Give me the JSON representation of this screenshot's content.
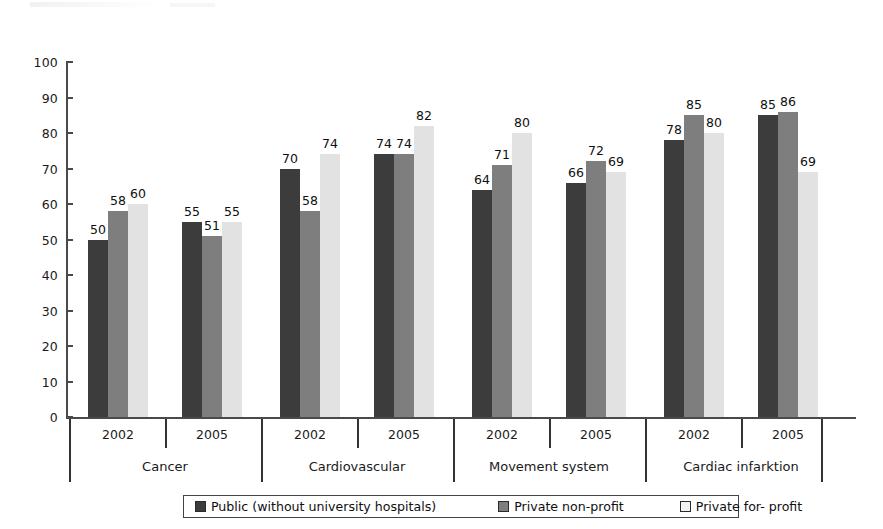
{
  "chart_data": {
    "type": "bar",
    "title": "",
    "subtitle": "",
    "xlabel": "",
    "ylabel": "",
    "ylim": [
      0,
      100
    ],
    "ytick_values": [
      0,
      10,
      20,
      30,
      40,
      50,
      60,
      70,
      80,
      90,
      100
    ],
    "grid": false,
    "legend_position": "bottom",
    "series": [
      {
        "name": "Public (without university hospitals)",
        "color": "#3c3c3c",
        "values": [
          50,
          55,
          70,
          74,
          64,
          66,
          78,
          85
        ]
      },
      {
        "name": "Private non-profit",
        "color": "#7e7e7e",
        "values": [
          58,
          51,
          58,
          74,
          71,
          72,
          85,
          86
        ]
      },
      {
        "name": "Private for- profit",
        "color": "#e2e2e2",
        "values": [
          60,
          55,
          74,
          82,
          80,
          69,
          80,
          69
        ]
      }
    ],
    "categories": [
      "2002",
      "2005",
      "2002",
      "2005",
      "2002",
      "2005",
      "2002",
      "2005"
    ],
    "groups": [
      {
        "label": "Cancer",
        "years": [
          "2002",
          "2005"
        ]
      },
      {
        "label": "Cardiovascular",
        "years": [
          "2002",
          "2005"
        ]
      },
      {
        "label": "Movement system",
        "years": [
          "2002",
          "2005"
        ]
      },
      {
        "label": "Cardiac infarktion",
        "years": [
          "2002",
          "2005"
        ]
      }
    ],
    "data_labels": [
      [
        50,
        58,
        60
      ],
      [
        55,
        51,
        55
      ],
      [
        70,
        58,
        74
      ],
      [
        74,
        74,
        82
      ],
      [
        64,
        71,
        80
      ],
      [
        66,
        72,
        69
      ],
      [
        78,
        85,
        80
      ],
      [
        85,
        86,
        69
      ]
    ]
  },
  "legend": {
    "items": [
      {
        "label": "Public (without university hospitals)",
        "color": "#3c3c3c"
      },
      {
        "label": "Private non-profit",
        "color": "#7e7e7e"
      },
      {
        "label": "Private for- profit",
        "color": "#f2f2f2"
      }
    ]
  }
}
